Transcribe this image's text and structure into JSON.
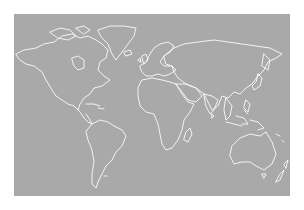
{
  "map": {
    "type": "world-outline-map",
    "projection": "equirectangular-like",
    "background_color": "#a9a9a9",
    "outline_color": "#ffffff",
    "page_background": "#ffffff",
    "regions": [
      "north-america",
      "greenland",
      "south-america",
      "europe",
      "africa",
      "asia",
      "australia",
      "new-zealand",
      "indonesia",
      "japan",
      "madagascar"
    ]
  }
}
